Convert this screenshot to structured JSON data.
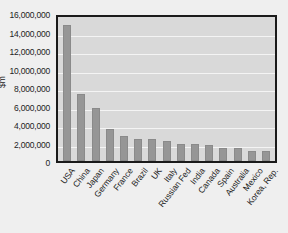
{
  "chart_data": {
    "type": "bar",
    "title": "",
    "xlabel": "",
    "ylabel": "$m",
    "ylim": [
      0,
      16000000
    ],
    "ytick_step": 2000000,
    "grid": true,
    "legend": "none",
    "orientation": "vertical",
    "bar_color": "#969696",
    "plot_background": "#d9d9d9",
    "page_background": "#efefef",
    "axis_color": "#1a1a1a",
    "gridline_color": "#f4f4f4",
    "categories": [
      "USA",
      "China",
      "Japan",
      "Germany",
      "France",
      "Brazil",
      "UK",
      "Italy",
      "Russian Fed",
      "India",
      "Canada",
      "Spain",
      "Australia",
      "Mexico",
      "Korea, Rep."
    ],
    "values": [
      15100000,
      7400000,
      5900000,
      3600000,
      2780000,
      2500000,
      2450000,
      2180000,
      1850000,
      1850000,
      1780000,
      1500000,
      1400000,
      1160000,
      1150000
    ],
    "ytick_labels": [
      "16,000,000",
      "14,000,000",
      "12,000,000",
      "10,000,000",
      "8,000,000",
      "6,000,000",
      "4,000,000",
      "2,000,000",
      "0"
    ],
    "ytick_values": [
      16000000,
      14000000,
      12000000,
      10000000,
      8000000,
      6000000,
      4000000,
      2000000,
      0
    ]
  }
}
